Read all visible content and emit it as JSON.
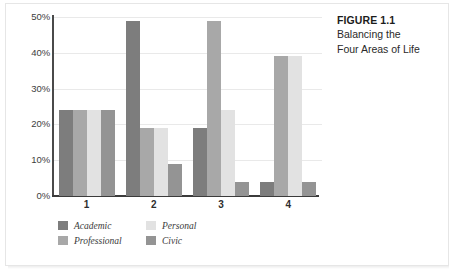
{
  "caption": {
    "title": "FIGURE 1.1",
    "lines": [
      "Balancing the",
      "Four Areas of Life"
    ]
  },
  "colors": {
    "academic": "#7d7d7d",
    "professional": "#a8a8a8",
    "personal": "#e2e2e2",
    "civic": "#949494",
    "axis": "#3b3b3b",
    "gridline": "#e9e9e9",
    "frame": "#e6e6e6",
    "text": "#2e2e2e"
  },
  "chart_data": {
    "type": "bar",
    "title": "",
    "xlabel": "",
    "ylabel": "",
    "categories": [
      "1",
      "2",
      "3",
      "4"
    ],
    "ylim": [
      0,
      50
    ],
    "yticks": [
      0,
      10,
      20,
      30,
      40,
      50
    ],
    "ytick_labels": [
      "0%",
      "10%",
      "20%",
      "30%",
      "40%",
      "50%"
    ],
    "grid": true,
    "legend_position": "bottom-left",
    "series": [
      {
        "name": "Academic",
        "color": "#7d7d7d",
        "values": [
          24,
          49,
          19,
          4
        ]
      },
      {
        "name": "Professional",
        "color": "#a8a8a8",
        "values": [
          24,
          19,
          49,
          39
        ]
      },
      {
        "name": "Personal",
        "color": "#e2e2e2",
        "values": [
          24,
          19,
          24,
          39
        ]
      },
      {
        "name": "Civic",
        "color": "#949494",
        "values": [
          24,
          9,
          4,
          4
        ]
      }
    ]
  },
  "legend": {
    "items": [
      {
        "label": "Academic",
        "color": "#7d7d7d"
      },
      {
        "label": "Professional",
        "color": "#a8a8a8"
      },
      {
        "label": "Personal",
        "color": "#e2e2e2"
      },
      {
        "label": "Civic",
        "color": "#949494"
      }
    ]
  }
}
